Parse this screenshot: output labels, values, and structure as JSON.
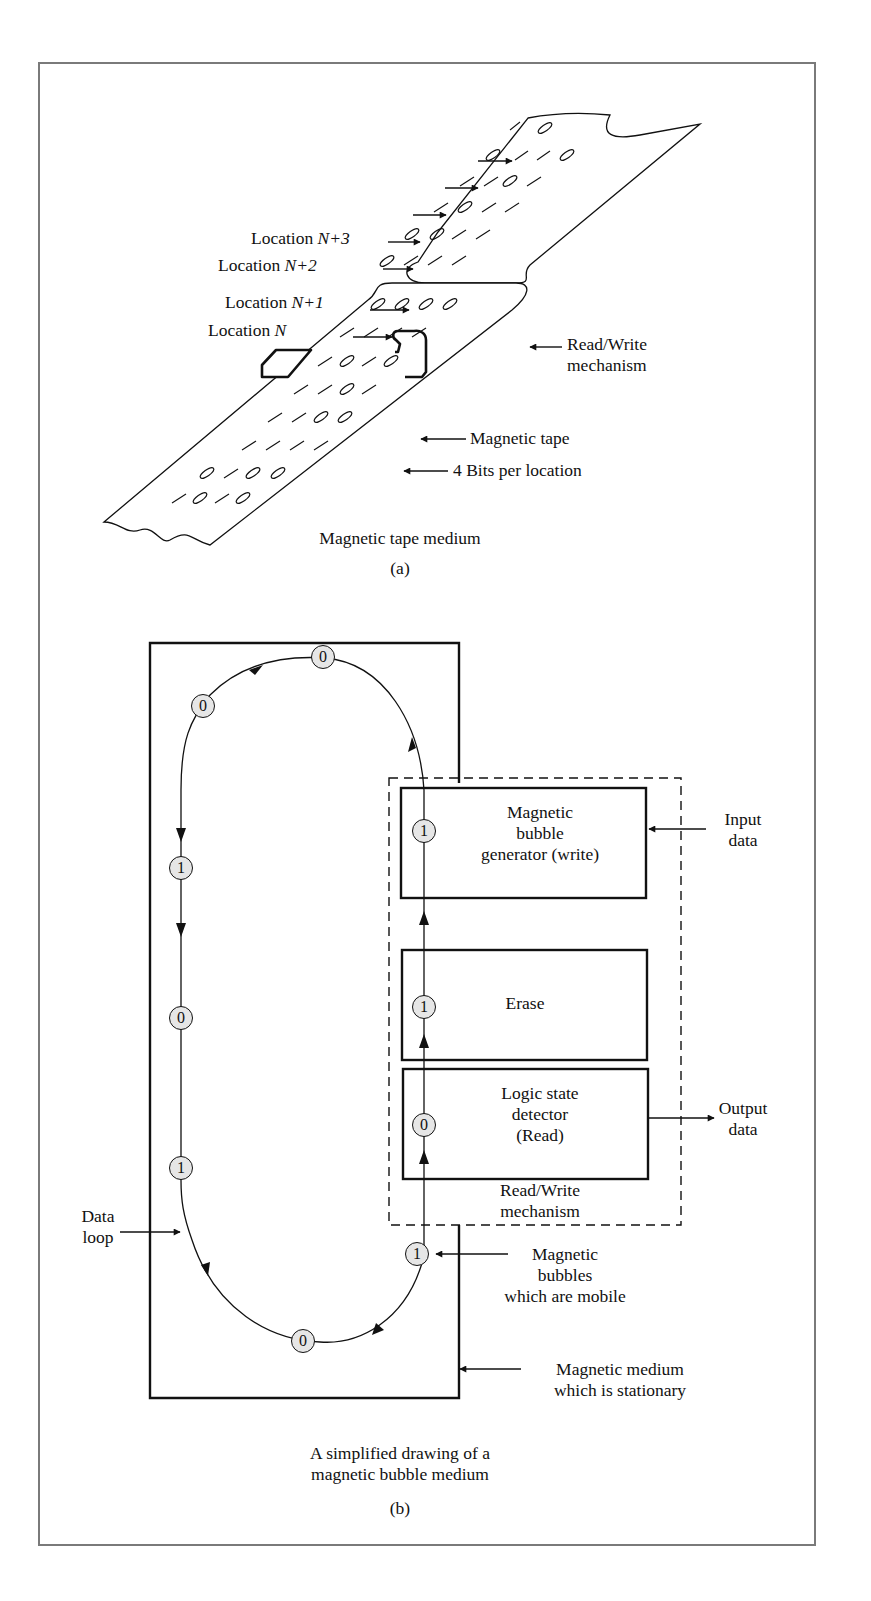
{
  "figure_a": {
    "labels": {
      "loc_n3_prefix": "Location ",
      "loc_n3_var": "N+3",
      "loc_n2_prefix": "Location ",
      "loc_n2_var": "N+2",
      "loc_n1_prefix": "Location ",
      "loc_n1_var": "N+1",
      "loc_n_prefix": "Location ",
      "loc_n_var": "N",
      "rw_line1": "Read/Write",
      "rw_line2": "mechanism",
      "tape": "Magnetic tape",
      "bits": "4 Bits per location"
    },
    "caption": "Magnetic tape medium",
    "tag": "(a)"
  },
  "figure_b": {
    "blocks": {
      "generator_l1": "Magnetic",
      "generator_l2": "bubble",
      "generator_l3": "generator (write)",
      "erase": "Erase",
      "detector_l1": "Logic state",
      "detector_l2": "detector",
      "detector_l3": "(Read)"
    },
    "labels": {
      "input_l1": "Input",
      "input_l2": "data",
      "output_l1": "Output",
      "output_l2": "data",
      "rw_l1": "Read/Write",
      "rw_l2": "mechanism",
      "data_loop_l1": "Data",
      "data_loop_l2": "loop",
      "bubbles_l1": "Magnetic",
      "bubbles_l2": "bubbles",
      "bubbles_l3": "which are mobile",
      "medium_l1": "Magnetic medium",
      "medium_l2": "which is stationary"
    },
    "bubbles": [
      "0",
      "0",
      "1",
      "0",
      "1",
      "0",
      "1",
      "1",
      "1",
      "0"
    ],
    "caption_l1": "A simplified drawing of a",
    "caption_l2": "magnetic bubble medium",
    "tag": "(b)"
  }
}
